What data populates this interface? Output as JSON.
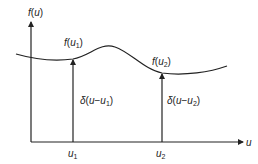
{
  "diagram": {
    "type": "sampling-with-impulses",
    "axes": {
      "y_label": {
        "func": "f",
        "arg": "u"
      },
      "x_label": "u"
    },
    "curve": {
      "name": "f(u)",
      "color": "#222222"
    },
    "samples": [
      {
        "id": "u1",
        "position_label": {
          "base": "u",
          "sub": "1"
        },
        "value_label": {
          "func": "f",
          "arg": "u",
          "sub": "1"
        },
        "impulse_label": {
          "delta": "δ",
          "arg": "u",
          "minus": "−",
          "var": "u",
          "sub": "1"
        }
      },
      {
        "id": "u2",
        "position_label": {
          "base": "u",
          "sub": "2"
        },
        "value_label": {
          "func": "f",
          "arg": "u",
          "sub": "2"
        },
        "impulse_label": {
          "delta": "δ",
          "arg": "u",
          "minus": "−",
          "var": "u",
          "sub": "2"
        }
      }
    ],
    "colors": {
      "line": "#222222",
      "background": "#ffffff"
    }
  }
}
